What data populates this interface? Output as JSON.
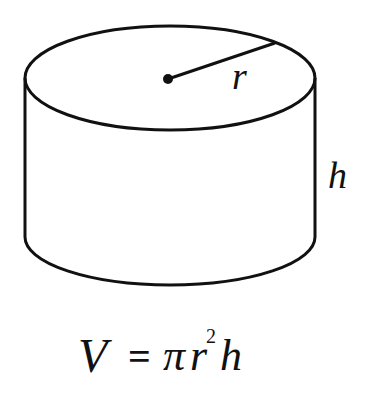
{
  "diagram": {
    "shape": "cylinder",
    "labels": {
      "radius": "r",
      "height": "h"
    },
    "formula": {
      "lhs": "V",
      "equals": "=",
      "pi": "π",
      "r": "r",
      "exponent": "2",
      "h": "h"
    },
    "colors": {
      "stroke": "#111111",
      "background": "#ffffff"
    }
  }
}
